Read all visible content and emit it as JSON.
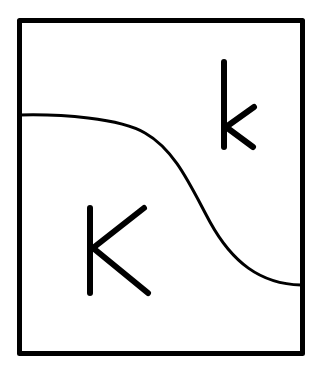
{
  "diagram": {
    "type": "region-partition",
    "colors": {
      "stroke": "#000000",
      "background": "#ffffff"
    },
    "regions": [
      {
        "id": "lower-left",
        "label": "K"
      },
      {
        "id": "upper-right",
        "label": "k"
      }
    ]
  }
}
